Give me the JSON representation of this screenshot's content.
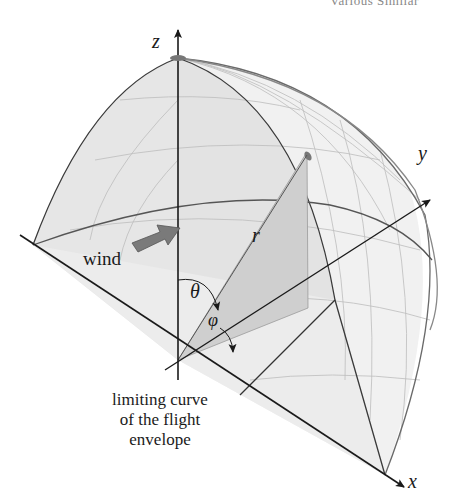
{
  "header": {
    "running_title": "Various Similar"
  },
  "figure": {
    "axes": {
      "x": "x",
      "y": "y",
      "z": "z"
    },
    "labels": {
      "r": "r",
      "theta": "θ",
      "phi": "φ",
      "wind": "wind"
    },
    "caption_lines": [
      "limiting curve",
      "of the flight",
      "envelope"
    ],
    "colors": {
      "fill": "#e4e4e4",
      "line": "#333333",
      "sector": "#c8c8c8",
      "arrow": "#7a7a7a"
    }
  }
}
